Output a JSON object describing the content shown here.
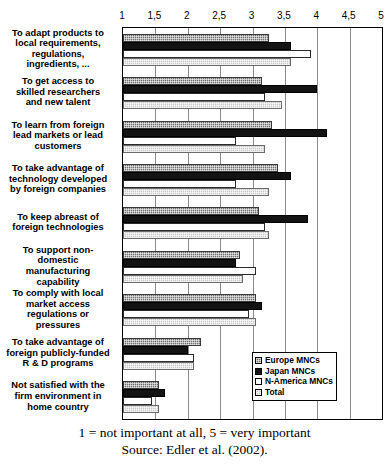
{
  "chart_data": {
    "type": "bar",
    "orientation": "horizontal",
    "title": "",
    "xlabel": "",
    "ylabel": "",
    "xlim": [
      1,
      5
    ],
    "grid": true,
    "legend_position": "bottom-right",
    "tick_labels": [
      "1",
      "1,5",
      "2",
      "2,5",
      "3",
      "3,5",
      "4",
      "4,5",
      "5"
    ],
    "tick_values": [
      1,
      1.5,
      2,
      2.5,
      3,
      3.5,
      4,
      4.5,
      5
    ],
    "categories": [
      "To adapt products to local requirements, regulations, ingredients, ...",
      "To get access to skilled researchers and new talent",
      "To learn from foreign lead markets or lead customers",
      "To take advantage of technology developed by foreign companies",
      "To keep abreast of foreign technologies",
      "To support non-domestic manufacturing capability",
      "To comply with local market access regulations or pressures",
      "To take advantage of foreign publicly-funded R & D programs",
      "Not satisfied with the firm environment in home country"
    ],
    "category_lines": [
      [
        "To adapt products to",
        "local requirements,",
        "regulations,",
        "ingredients, ..."
      ],
      [
        "To get access to",
        "skilled researchers",
        "and new talent"
      ],
      [
        "To learn from foreign",
        "lead markets or lead",
        "customers"
      ],
      [
        "To take advantage of",
        "technology developed",
        "by foreign companies"
      ],
      [
        "To keep abreast of",
        "foreign technologies"
      ],
      [
        "To support non-",
        "domestic",
        "manufacturing",
        "capability"
      ],
      [
        "To comply with local",
        "market access",
        "regulations or",
        "pressures"
      ],
      [
        "To take advantage of",
        "foreign publicly-funded",
        "R & D programs"
      ],
      [
        "Not satisfied with the",
        "firm environment in",
        "home country"
      ]
    ],
    "series": [
      {
        "name": "Europe MNCs",
        "color": "#6e6e6e",
        "values": [
          3.25,
          3.15,
          3.3,
          3.4,
          3.1,
          2.8,
          3.05,
          2.2,
          1.55
        ]
      },
      {
        "name": "Japan MNCs",
        "color": "#131313",
        "values": [
          3.6,
          4.0,
          4.15,
          3.6,
          3.85,
          2.75,
          3.15,
          2.0,
          1.65
        ]
      },
      {
        "name": "N-America MNCs",
        "color": "#ffffff",
        "values": [
          3.9,
          3.2,
          2.75,
          2.75,
          3.2,
          3.05,
          2.95,
          2.1,
          1.45
        ]
      },
      {
        "name": "Total",
        "color": "#c9c9c9",
        "values": [
          3.6,
          3.45,
          3.2,
          3.25,
          3.25,
          2.85,
          3.05,
          2.1,
          1.55
        ]
      }
    ]
  },
  "legend": {
    "items": [
      {
        "label": "Europe MNCs",
        "key": "europe"
      },
      {
        "label": "Japan MNCs",
        "key": "japan"
      },
      {
        "label": "N-America MNCs",
        "key": "namerica"
      },
      {
        "label": "Total",
        "key": "total"
      }
    ]
  },
  "footer": {
    "scale_note": "1 = not important at all, 5 = very important",
    "source": "Source: Edler et al. (2002)."
  }
}
